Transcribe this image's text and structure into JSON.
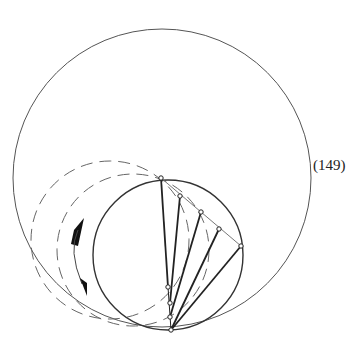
{
  "figure": {
    "equation_label": "(149)",
    "stroke_color": "#333333",
    "big_circle": {
      "cx": 162,
      "cy": 178,
      "r": 149
    },
    "small_circle": {
      "cx": 168,
      "cy": 255,
      "r": 75
    },
    "dashed_circles": [
      {
        "cx": 110,
        "cy": 240,
        "r": 79
      },
      {
        "cx": 133,
        "cy": 250,
        "r": 76
      }
    ],
    "apex_point": [
      161,
      178
    ],
    "chord_points": [
      [
        180,
        196
      ],
      [
        201,
        212
      ],
      [
        219,
        229
      ],
      [
        241,
        246
      ]
    ],
    "lower_points": [
      [
        168,
        287
      ],
      [
        170,
        303
      ],
      [
        170,
        317
      ],
      [
        171,
        330
      ]
    ]
  }
}
